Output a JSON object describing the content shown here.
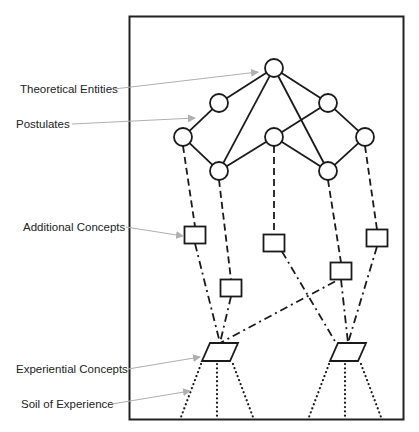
{
  "diagram": {
    "colors": {
      "line": "#1a1a1a",
      "arrow": "#b0b0b0",
      "frame": "#222222",
      "text": "#222222"
    },
    "labels": [
      {
        "id": "theoretical-entities",
        "text": "Theoretical Entities",
        "x": 20,
        "y": 93,
        "arrow_from": [
          114,
          89
        ],
        "arrow_to": [
          258,
          72
        ]
      },
      {
        "id": "postulates",
        "text": "Postulates",
        "x": 16,
        "y": 128,
        "arrow_from": [
          72,
          124
        ],
        "arrow_to": [
          195,
          118
        ]
      },
      {
        "id": "additional-concepts",
        "text": "Additional Concepts",
        "x": 23,
        "y": 231,
        "arrow_from": [
          126,
          227
        ],
        "arrow_to": [
          183,
          236
        ]
      },
      {
        "id": "experiential-concepts",
        "text": "Experiential Concepts",
        "x": 16,
        "y": 373,
        "arrow_from": [
          128,
          369
        ],
        "arrow_to": [
          200,
          357
        ]
      },
      {
        "id": "soil-of-experience",
        "text": "Soil of Experience",
        "x": 21,
        "y": 408,
        "arrow_from": [
          112,
          404
        ],
        "arrow_to": [
          190,
          391
        ]
      }
    ],
    "theory_nodes": [
      {
        "id": "t0",
        "x": 274,
        "y": 68
      },
      {
        "id": "p1",
        "x": 219,
        "y": 103
      },
      {
        "id": "p2",
        "x": 328,
        "y": 103
      },
      {
        "id": "p3",
        "x": 183,
        "y": 137
      },
      {
        "id": "p4",
        "x": 274,
        "y": 137
      },
      {
        "id": "p5",
        "x": 365,
        "y": 137
      },
      {
        "id": "p6",
        "x": 219,
        "y": 171
      },
      {
        "id": "p7",
        "x": 328,
        "y": 171
      }
    ],
    "theory_edges": [
      [
        "t0",
        "p1"
      ],
      [
        "t0",
        "p2"
      ],
      [
        "t0",
        "p6"
      ],
      [
        "t0",
        "p7"
      ],
      [
        "p1",
        "p3"
      ],
      [
        "p2",
        "p5"
      ],
      [
        "p2",
        "p4"
      ],
      [
        "p3",
        "p6"
      ],
      [
        "p5",
        "p7"
      ],
      [
        "p6",
        "p4"
      ],
      [
        "p4",
        "p7"
      ]
    ],
    "concept_boxes": [
      {
        "id": "c1",
        "x": 195,
        "y": 235,
        "from": "p3"
      },
      {
        "id": "c2",
        "x": 231,
        "y": 288,
        "from": "p6"
      },
      {
        "id": "c3",
        "x": 274,
        "y": 243,
        "from": "p4"
      },
      {
        "id": "c4",
        "x": 341,
        "y": 271,
        "from": "p7"
      },
      {
        "id": "c5",
        "x": 377,
        "y": 238,
        "from": "p5"
      }
    ],
    "experiential_concepts": [
      {
        "id": "e1",
        "x": 220,
        "y": 352,
        "from": [
          "c1",
          "c2",
          "c4"
        ]
      },
      {
        "id": "e2",
        "x": 348,
        "y": 352,
        "from": [
          "c3",
          "c4",
          "c5"
        ]
      }
    ]
  }
}
